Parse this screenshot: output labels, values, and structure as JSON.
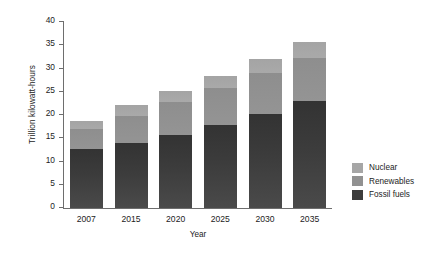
{
  "chart_data": {
    "type": "bar",
    "subtype": "stacked-bar",
    "title": "",
    "xlabel": "Year",
    "ylabel": "Trillion kilowatt-hours",
    "categories": [
      "2007",
      "2015",
      "2020",
      "2025",
      "2030",
      "2035"
    ],
    "ylim": [
      0,
      40
    ],
    "yticks": [
      0,
      5,
      10,
      15,
      20,
      25,
      30,
      35,
      40
    ],
    "ytick_labels": [
      "0",
      "5",
      "10",
      "15",
      "20",
      "25",
      "30",
      "35",
      "40"
    ],
    "grid": false,
    "legend_position": "right",
    "stack_order_bottom_to_top": [
      "Fossil fuels",
      "Renewables",
      "Nuclear"
    ],
    "series": [
      {
        "name": "Fossil fuels",
        "color": "#3c3c3c",
        "values": [
          12.7,
          14.0,
          15.7,
          17.9,
          20.3,
          23.0
        ]
      },
      {
        "name": "Renewables",
        "color": "#919191",
        "values": [
          4.2,
          5.8,
          7.0,
          8.0,
          8.7,
          9.3
        ]
      },
      {
        "name": "Nuclear",
        "color": "#a6a6a6",
        "values": [
          1.9,
          2.3,
          2.4,
          2.5,
          3.0,
          3.4
        ]
      }
    ],
    "totals": [
      18.8,
      22.1,
      25.1,
      28.4,
      32.0,
      35.7
    ]
  },
  "legend": {
    "items": [
      {
        "label": "Nuclear",
        "color": "#a6a6a6"
      },
      {
        "label": "Renewables",
        "color": "#919191"
      },
      {
        "label": "Fossil fuels",
        "color": "#3c3c3c"
      }
    ]
  },
  "colors": {
    "axis": "#6e6e6e",
    "text": "#1c1c1c",
    "background": "#ffffff"
  }
}
